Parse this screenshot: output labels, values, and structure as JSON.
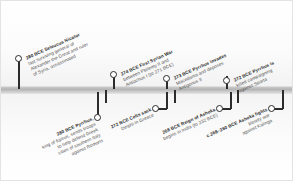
{
  "timeline": {
    "title": "Hellenistic and Mauryan events timeline",
    "axis_color": "#b4b4b4",
    "marker_color": "#2b2b2b",
    "text_color": "#4a4a4a",
    "events_above": [
      {
        "id": "seleucus-nicator",
        "date": "280 BCE",
        "headline": "Seleucus Nicator",
        "lines": [
          "last surviving general of",
          "Alexander the Great and ruler",
          "of Syria, assassinated"
        ]
      },
      {
        "id": "first-syrian-war",
        "date": "274 BCE",
        "headline": "First Syrian War",
        "lines": [
          "between Ptolemy II and",
          "Antiochus I (to 271 BCE)"
        ]
      },
      {
        "id": "pyrrhus-invades-macedonia",
        "date": "273 BCE",
        "headline": "Pyrrhus invades",
        "lines": [
          "Macedonia and deposes",
          "Antigonus II"
        ]
      },
      {
        "id": "pyrrhus-killed",
        "date": "272 BCE",
        "headline": "Pyrrhus is",
        "lines": [
          "killed campaigning",
          "against Sparta"
        ]
      }
    ],
    "events_below": [
      {
        "id": "pyrrhus-sends-troops",
        "date": "280 BCE",
        "headline": "Pyrrhus,",
        "lines": [
          "king of Epirus, sends troops",
          "to help defend Greek",
          "cities of southern Italy",
          "against Romans"
        ]
      },
      {
        "id": "celts-sack-delphi",
        "date": "272 BCE",
        "headline": "Celts sack",
        "lines": [
          "Delphi in Greece"
        ]
      },
      {
        "id": "reign-of-ashoka",
        "date": "268 BCE",
        "headline": "Reign of Ashoka",
        "lines": [
          "begins in India (to 232 BCE)"
        ]
      },
      {
        "id": "kalinga-war",
        "date": "c.268–260 BCE",
        "headline": "Ashoka fights",
        "lines": [
          "bloody war",
          "against Kalinga"
        ]
      }
    ]
  }
}
